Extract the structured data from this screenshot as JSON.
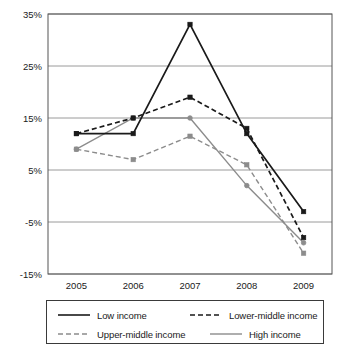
{
  "chart_data": {
    "type": "line",
    "title": "",
    "xlabel": "",
    "ylabel": "",
    "categories": [
      "2005",
      "2006",
      "2007",
      "2008",
      "2009"
    ],
    "ytick_labels": [
      "35%",
      "25%",
      "15%",
      "5%",
      "-5%",
      "-15%"
    ],
    "ytick_values": [
      35,
      25,
      15,
      5,
      -5,
      -15
    ],
    "ylim": [
      -15,
      35
    ],
    "grid": "horizontal",
    "legend_position": "bottom",
    "series": [
      {
        "name": "Low income",
        "values": [
          12,
          12,
          33,
          12,
          -3
        ],
        "color": "#1a1a1a",
        "style": "solid",
        "marker": "square"
      },
      {
        "name": "Lower-middle income",
        "values": [
          12,
          15,
          19,
          13,
          -8
        ],
        "color": "#1a1a1a",
        "style": "dashed",
        "marker": "square"
      },
      {
        "name": "Upper-middle income",
        "values": [
          9,
          7,
          11.5,
          6,
          -11
        ],
        "color": "#8c8c8c",
        "style": "dashed",
        "marker": "square"
      },
      {
        "name": "High income",
        "values": [
          9,
          15,
          15,
          2,
          -9
        ],
        "color": "#8c8c8c",
        "style": "solid",
        "marker": "circle"
      }
    ]
  },
  "legend": {
    "entries": [
      {
        "label": "Low income"
      },
      {
        "label": "Lower-middle income"
      },
      {
        "label": "Upper-middle income"
      },
      {
        "label": "High income"
      }
    ]
  },
  "colors": {
    "dark_line": "#1a1a1a",
    "gray_line": "#8c8c8c",
    "grid": "#9a9a9a",
    "axis": "#555555",
    "text": "#1a1a1a"
  }
}
